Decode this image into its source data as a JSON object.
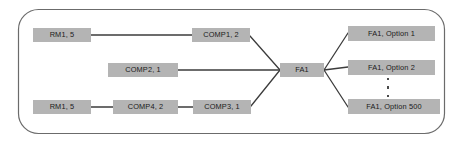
{
  "diagram": {
    "frame": {
      "shape": "rounded-rectangle",
      "stroke_color": "#6b6b6b",
      "fill_color": "#ffffff"
    },
    "node_style": {
      "fill_color": "#b4b4b4",
      "text_color": "#1a1a1a"
    },
    "edge_style": {
      "stroke_color": "#3c3c3c"
    },
    "nodes": [
      {
        "id": "rm1_top",
        "label": "RM1, 5",
        "x": 33,
        "y": 28,
        "w": 58,
        "h": 14
      },
      {
        "id": "comp1",
        "label": "COMP1, 2",
        "x": 192,
        "y": 28,
        "w": 58,
        "h": 14
      },
      {
        "id": "comp2",
        "label": "COMP2, 1",
        "x": 108,
        "y": 63,
        "w": 70,
        "h": 14
      },
      {
        "id": "fa1",
        "label": "FA1",
        "x": 280,
        "y": 63,
        "w": 44,
        "h": 14
      },
      {
        "id": "rm1_bot",
        "label": "RM1, 5",
        "x": 33,
        "y": 100,
        "w": 58,
        "h": 14
      },
      {
        "id": "comp4",
        "label": "COMP4, 2",
        "x": 113,
        "y": 100,
        "w": 65,
        "h": 14
      },
      {
        "id": "comp3",
        "label": "COMP3, 1",
        "x": 193,
        "y": 100,
        "w": 58,
        "h": 14
      },
      {
        "id": "option1",
        "label": "FA1, Option 1",
        "x": 348,
        "y": 26,
        "w": 87,
        "h": 15
      },
      {
        "id": "option2",
        "label": "FA1, Option 2",
        "x": 348,
        "y": 60,
        "w": 87,
        "h": 15
      },
      {
        "id": "option500",
        "label": "FA1, Option 500",
        "x": 348,
        "y": 99,
        "w": 92,
        "h": 15
      }
    ],
    "ellipsis": {
      "x": 387,
      "y": 78,
      "dot_count": 3
    },
    "edges": [
      {
        "id": "rm1top-comp1",
        "from": "rm1_top",
        "to": "comp1",
        "x1": 91,
        "y1": 35,
        "x2": 192,
        "y2": 35
      },
      {
        "id": "comp1-fa1",
        "from": "comp1",
        "to": "fa1",
        "x1": 250,
        "y1": 36,
        "x2": 280,
        "y2": 70
      },
      {
        "id": "comp2-fa1",
        "from": "comp2",
        "to": "fa1",
        "x1": 178,
        "y1": 70,
        "x2": 280,
        "y2": 70
      },
      {
        "id": "rm1bot-comp4",
        "from": "rm1_bot",
        "to": "comp4",
        "x1": 91,
        "y1": 107,
        "x2": 113,
        "y2": 107
      },
      {
        "id": "comp4-comp3",
        "from": "comp4",
        "to": "comp3",
        "x1": 178,
        "y1": 107,
        "x2": 193,
        "y2": 107
      },
      {
        "id": "comp3-fa1",
        "from": "comp3",
        "to": "fa1",
        "x1": 251,
        "y1": 106,
        "x2": 280,
        "y2": 70
      },
      {
        "id": "fa1-option1",
        "from": "fa1",
        "to": "option1",
        "x1": 324,
        "y1": 70,
        "x2": 348,
        "y2": 33
      },
      {
        "id": "fa1-option2",
        "from": "fa1",
        "to": "option2",
        "x1": 324,
        "y1": 70,
        "x2": 348,
        "y2": 67
      },
      {
        "id": "fa1-option500",
        "from": "fa1",
        "to": "option500",
        "x1": 324,
        "y1": 70,
        "x2": 348,
        "y2": 107
      }
    ]
  }
}
